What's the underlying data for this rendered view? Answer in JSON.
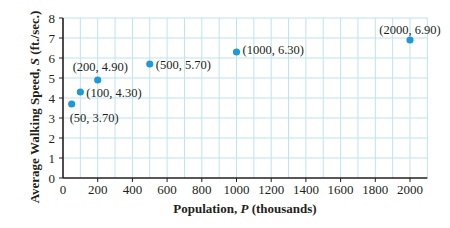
{
  "chart_data": {
    "type": "scatter",
    "title": "",
    "xlabel": "Population, P (thousands)",
    "xlabel_parts": [
      "Population, ",
      "P",
      " (thousands)"
    ],
    "ylabel": "Average Walking Speed, S (ft./sec.)",
    "ylabel_parts": [
      "Average Walking Speed, ",
      "S",
      " (ft./sec.)"
    ],
    "xlim": [
      0,
      2100
    ],
    "ylim": [
      0,
      8
    ],
    "x_ticks": [
      0,
      200,
      400,
      600,
      800,
      1000,
      1200,
      1400,
      1600,
      1800,
      2000
    ],
    "y_ticks": [
      0,
      1,
      2,
      3,
      4,
      5,
      6,
      7,
      8
    ],
    "x_minor_step": 100,
    "grid": true,
    "legend": null,
    "series": [
      {
        "name": "Walking speed vs population",
        "color": "#1f9ad6",
        "points": [
          {
            "x": 50,
            "y": 3.7,
            "label": "(50, 3.70)"
          },
          {
            "x": 100,
            "y": 4.3,
            "label": "(100, 4.30)"
          },
          {
            "x": 200,
            "y": 4.9,
            "label": "(200, 4.90)"
          },
          {
            "x": 500,
            "y": 5.7,
            "label": "(500, 5.70)"
          },
          {
            "x": 1000,
            "y": 6.3,
            "label": "(1000, 6.30)"
          },
          {
            "x": 2000,
            "y": 6.9,
            "label": "(2000, 6.90)"
          }
        ]
      }
    ]
  },
  "colors": {
    "grid": "#bfe3ef",
    "axis": "#231f20",
    "point": "#1f9ad6"
  }
}
